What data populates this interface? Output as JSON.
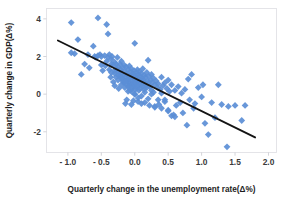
{
  "chart_data": {
    "type": "scatter",
    "title": "",
    "xlabel": "Quarterly change in the unemployment rate(Δ%)",
    "ylabel": "Quarterly change in GDP(Δ%)",
    "xlim": [
      -1.32,
      2.12
    ],
    "ylim": [
      -3.1,
      4.55
    ],
    "xticks": [
      -1.0,
      -0.5,
      0.0,
      0.5,
      1.0,
      1.5,
      2.0
    ],
    "xticklabels": [
      "- 1.0",
      "- 0.5",
      "0.0",
      "0.5",
      "1.0",
      "1.5",
      "2.0"
    ],
    "yticks": [
      4,
      2,
      0,
      -2
    ],
    "yticklabels": [
      "4",
      "2",
      "0",
      "-2"
    ],
    "grid": false,
    "legend": null,
    "marker": {
      "shape": "diamond",
      "color": "#5b8ed6",
      "size": 3.4
    },
    "trendline": {
      "color": "#141414",
      "x_start": -1.15,
      "y_start": 2.85,
      "x_end": 1.8,
      "y_end": -2.3,
      "slope": -1.75,
      "intercept": 0.84
    },
    "x": [
      -0.95,
      -0.9,
      -0.85,
      -0.95,
      -0.8,
      -0.75,
      -0.7,
      -0.68,
      -0.62,
      -0.6,
      -0.58,
      -0.55,
      -0.52,
      -0.5,
      -0.5,
      -0.48,
      -0.45,
      -0.44,
      -0.42,
      -0.4,
      -0.4,
      -0.38,
      -0.38,
      -0.36,
      -0.35,
      -0.35,
      -0.34,
      -0.32,
      -0.32,
      -0.3,
      -0.3,
      -0.3,
      -0.28,
      -0.28,
      -0.27,
      -0.26,
      -0.25,
      -0.25,
      -0.24,
      -0.24,
      -0.22,
      -0.22,
      -0.21,
      -0.2,
      -0.2,
      -0.2,
      -0.19,
      -0.18,
      -0.18,
      -0.17,
      -0.16,
      -0.16,
      -0.15,
      -0.15,
      -0.14,
      -0.14,
      -0.13,
      -0.12,
      -0.12,
      -0.12,
      -0.11,
      -0.1,
      -0.1,
      -0.1,
      -0.09,
      -0.09,
      -0.08,
      -0.08,
      -0.07,
      -0.07,
      -0.06,
      -0.06,
      -0.05,
      -0.05,
      -0.05,
      -0.04,
      -0.04,
      -0.03,
      -0.03,
      -0.02,
      -0.02,
      -0.02,
      -0.01,
      -0.01,
      0.0,
      0.0,
      0.0,
      0.0,
      0.01,
      0.01,
      0.02,
      0.02,
      0.03,
      0.03,
      0.04,
      0.04,
      0.05,
      0.05,
      0.05,
      0.06,
      0.06,
      0.07,
      0.07,
      0.08,
      0.08,
      0.09,
      0.1,
      0.1,
      0.1,
      0.11,
      0.12,
      0.12,
      0.13,
      0.14,
      0.14,
      0.15,
      0.15,
      0.16,
      0.17,
      0.18,
      0.18,
      0.19,
      0.2,
      0.2,
      0.21,
      0.22,
      0.22,
      0.24,
      0.25,
      0.25,
      0.26,
      0.28,
      0.28,
      0.3,
      0.3,
      0.32,
      0.34,
      0.35,
      0.36,
      0.38,
      0.4,
      0.4,
      0.42,
      0.45,
      0.45,
      0.48,
      0.5,
      0.5,
      0.52,
      0.55,
      0.58,
      0.6,
      0.62,
      0.65,
      0.68,
      0.7,
      0.72,
      0.75,
      0.78,
      0.8,
      0.82,
      0.85,
      0.88,
      0.9,
      0.95,
      1.0,
      1.02,
      1.05,
      1.1,
      1.15,
      1.2,
      1.25,
      1.3,
      1.38,
      1.4,
      1.5,
      1.6,
      1.65,
      0.55,
      0.6,
      -0.55,
      -0.42,
      -0.35,
      -0.3,
      -0.25,
      -0.2,
      -0.15,
      -0.1,
      -0.05,
      0.0,
      0.05,
      0.1,
      0.15,
      0.2,
      0.25,
      0.3,
      0.35,
      0.4,
      0.45,
      0.5
    ],
    "y": [
      3.8,
      2.15,
      2.9,
      2.2,
      1.05,
      1.6,
      2.1,
      1.4,
      2.55,
      2.0,
      1.95,
      4.05,
      2.1,
      2.0,
      1.55,
      1.25,
      2.05,
      1.5,
      3.7,
      3.2,
      1.95,
      2.1,
      1.3,
      0.9,
      1.85,
      1.15,
      2.0,
      1.55,
      0.65,
      1.7,
      1.1,
      0.45,
      1.6,
      0.9,
      1.35,
      1.95,
      1.45,
      0.75,
      1.15,
      0.3,
      1.6,
      0.95,
      1.3,
      1.75,
      1.1,
      0.5,
      0.85,
      1.4,
      0.7,
      1.0,
      1.55,
      0.6,
      1.2,
      0.35,
      0.9,
      -0.5,
      1.45,
      1.05,
      0.55,
      -0.3,
      0.8,
      1.3,
      0.75,
      0.15,
      1.0,
      0.45,
      1.5,
      0.6,
      0.85,
      0.2,
      1.2,
      0.5,
      1.35,
      0.7,
      -0.55,
      0.95,
      0.3,
      1.1,
      0.55,
      0.8,
      0.4,
      -0.35,
      1.25,
      0.65,
      1.0,
      0.5,
      0.0,
      2.7,
      0.85,
      0.25,
      1.15,
      0.6,
      0.9,
      0.35,
      1.3,
      0.7,
      1.05,
      0.45,
      -0.4,
      0.8,
      0.2,
      1.2,
      0.55,
      0.95,
      0.3,
      0.7,
      1.1,
      0.5,
      -0.5,
      0.85,
      1.35,
      0.4,
      0.75,
      1.0,
      0.25,
      0.6,
      -0.45,
      0.9,
      0.45,
      1.15,
      0.35,
      0.7,
      1.8,
      0.55,
      0.95,
      0.4,
      -0.6,
      0.75,
      1.05,
      0.2,
      0.6,
      0.85,
      0.1,
      0.5,
      -0.7,
      0.7,
      0.35,
      0.55,
      -0.55,
      0.25,
      0.9,
      0.05,
      0.45,
      0.6,
      -0.3,
      0.3,
      0.75,
      -0.85,
      0.15,
      0.5,
      -1.1,
      0.2,
      -0.6,
      0.4,
      -0.45,
      0.05,
      -1.0,
      0.25,
      -1.65,
      0.8,
      -0.3,
      1.05,
      -0.75,
      -0.5,
      0.35,
      -0.15,
      0.5,
      -1.55,
      -2.15,
      -0.45,
      -1.25,
      0.5,
      -0.55,
      -2.8,
      -0.65,
      -0.6,
      -1.4,
      -0.6,
      -1.15,
      -1.2,
      2.05,
      1.75,
      1.6,
      1.25,
      1.0,
      0.85,
      0.65,
      0.4,
      0.15,
      0.0,
      -0.2,
      -0.1,
      0.1,
      -0.25,
      0.0,
      -0.65,
      -0.3,
      -0.75,
      -0.4,
      -0.9
    ]
  }
}
